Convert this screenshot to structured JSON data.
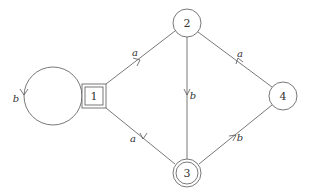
{
  "diagram": {
    "type": "finite-automaton",
    "nodes": [
      {
        "id": "1",
        "label": "1",
        "shape": "double-square",
        "initial": true
      },
      {
        "id": "2",
        "label": "2",
        "shape": "circle"
      },
      {
        "id": "3",
        "label": "3",
        "shape": "double-circle",
        "accepting": true
      },
      {
        "id": "4",
        "label": "4",
        "shape": "circle"
      }
    ],
    "edges": [
      {
        "from": "1",
        "to": "1",
        "label": "b"
      },
      {
        "from": "1",
        "to": "2",
        "label": "a"
      },
      {
        "from": "2",
        "to": "3",
        "label": "b"
      },
      {
        "from": "4",
        "to": "2",
        "label": "a"
      },
      {
        "from": "3",
        "to": "1",
        "label": "a"
      },
      {
        "from": "3",
        "to": "4",
        "label": "b"
      }
    ]
  },
  "labels": {
    "node1": "1",
    "node2": "2",
    "node3": "3",
    "node4": "4",
    "edge_1_1": "b",
    "edge_1_2": "a",
    "edge_2_3": "b",
    "edge_4_2": "a",
    "edge_3_1": "a",
    "edge_3_4": "b"
  }
}
